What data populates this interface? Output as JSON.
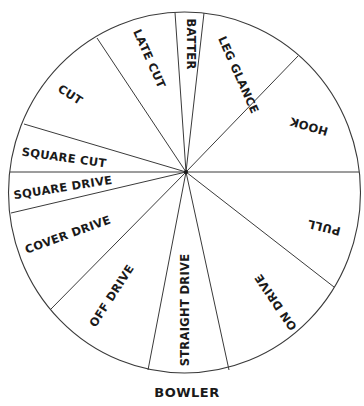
{
  "caption": "BOWLER",
  "colors": {
    "line": "#3a3a3a",
    "text": "#1a1a1a",
    "background": "#ffffff"
  },
  "shots": [
    {
      "id": "batter",
      "label": "BATTER"
    },
    {
      "id": "leg-glance",
      "label": "LEG GLANCE"
    },
    {
      "id": "hook",
      "label": "HOOK"
    },
    {
      "id": "pull",
      "label": "PULL"
    },
    {
      "id": "on-drive",
      "label": "ON DRIVE"
    },
    {
      "id": "straight-drive",
      "label": "STRAIGHT DRIVE"
    },
    {
      "id": "off-drive",
      "label": "OFF DRIVE"
    },
    {
      "id": "cover-drive",
      "label": "COVER DRIVE"
    },
    {
      "id": "square-drive",
      "label": "SQUARE DRIVE"
    },
    {
      "id": "square-cut",
      "label": "SQUARE CUT"
    },
    {
      "id": "cut",
      "label": "CUT"
    },
    {
      "id": "late-cut",
      "label": "LATE CUT"
    }
  ]
}
